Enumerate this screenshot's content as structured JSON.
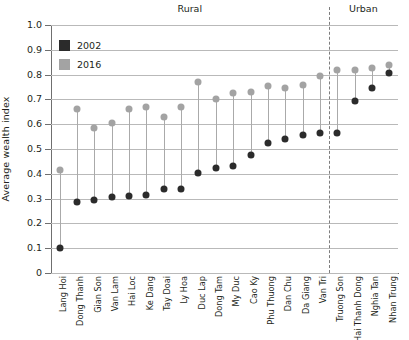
{
  "chart_data": {
    "type": "scatter",
    "title": "",
    "xlabel": "",
    "ylabel": "Average wealth index",
    "ylim": [
      0,
      1.0
    ],
    "ytick_labels": [
      "0",
      "0.1",
      "0.2",
      "0.3",
      "0.4",
      "0.5",
      "0.6",
      "0.7",
      "0.8",
      "0.9",
      "1.0"
    ],
    "ytick_values": [
      0,
      0.1,
      0.2,
      0.3,
      0.4,
      0.5,
      0.6,
      0.7,
      0.8,
      0.9,
      1.0
    ],
    "grid": true,
    "legend_position": "top-left",
    "categories": [
      "Lang Hoi",
      "Dong Thanh",
      "Gian Son",
      "Van Lam",
      "Hai Loc",
      "Ke Dang",
      "Tay Doai",
      "Ly Hoa",
      "Duc Lap",
      "Dong Tam",
      "My Duc",
      "Cao Ky",
      "Phu Thuong",
      "Dan Chu",
      "Da Giang",
      "Van Tri",
      "Truong Son",
      "Hai Thanh Dong",
      "Nghia Tan",
      "Nhan Trung"
    ],
    "series": [
      {
        "name": "2002",
        "color": "#2b2b2b",
        "values": [
          0.1,
          0.285,
          0.295,
          0.305,
          0.31,
          0.315,
          0.34,
          0.34,
          0.405,
          0.425,
          0.43,
          0.475,
          0.525,
          0.54,
          0.555,
          0.565,
          0.565,
          0.695,
          0.745,
          0.805
        ]
      },
      {
        "name": "2016",
        "color": "#a3a3a3",
        "values": [
          0.415,
          0.66,
          0.585,
          0.605,
          0.66,
          0.67,
          0.63,
          0.67,
          0.77,
          0.7,
          0.725,
          0.73,
          0.755,
          0.745,
          0.76,
          0.795,
          0.82,
          0.82,
          0.825,
          0.84
        ]
      }
    ],
    "groups": [
      {
        "label": "Rural",
        "start_index": 0,
        "end_index": 15
      },
      {
        "label": "Urban",
        "start_index": 16,
        "end_index": 19
      }
    ],
    "annotations": {
      "divider_after_index": 15,
      "divider_style": "dashed"
    }
  },
  "legend": {
    "items": [
      {
        "label": "2002",
        "color": "#2b2b2b"
      },
      {
        "label": "2016",
        "color": "#a3a3a3"
      }
    ]
  }
}
